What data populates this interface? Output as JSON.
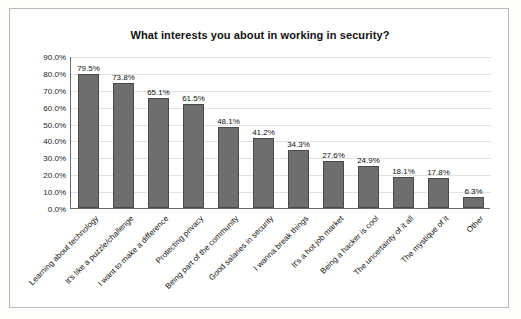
{
  "chart_data": {
    "type": "bar",
    "title": "What interests you about in working in security?",
    "xlabel": "",
    "ylabel": "",
    "ylim": [
      0,
      90
    ],
    "grid": true,
    "legend": "none",
    "ytick_labels": [
      "90.0%",
      "80.0%",
      "70.0%",
      "60.0%",
      "50.0%",
      "40.0%",
      "30.0%",
      "20.0%",
      "10.0%",
      "0.0%"
    ],
    "ytick_values": [
      90,
      80,
      70,
      60,
      50,
      40,
      30,
      20,
      10,
      0
    ],
    "categories": [
      "Learning about technology",
      "It's like a puzzle/challenge",
      "I want to make a difference",
      "Protecting privacy",
      "Being part of the community",
      "Good salaries in security",
      "I wanna break things",
      "It's a hot job market",
      "Being a hacker is cool",
      "The uncertainty of it all",
      "The mystique of it",
      "Other"
    ],
    "values": [
      79.5,
      73.8,
      65.1,
      61.5,
      48.1,
      41.2,
      34.3,
      27.6,
      24.9,
      18.1,
      17.8,
      6.3
    ],
    "data_labels": [
      "79.5%",
      "73.8%",
      "65.1%",
      "61.5%",
      "48.1%",
      "41.2%",
      "34.3%",
      "27.6%",
      "24.9%",
      "18.1%",
      "17.8%",
      "6.3%"
    ],
    "bar_color": "#6e6e6e"
  }
}
